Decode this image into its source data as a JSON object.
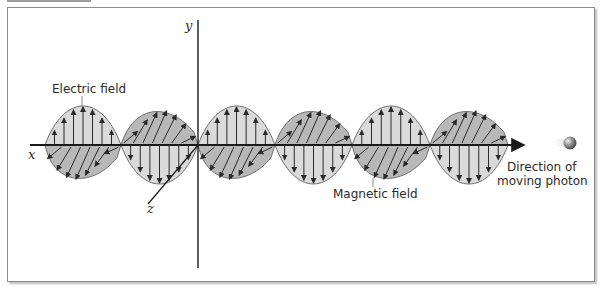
{
  "figure": {
    "axes": {
      "x_label": "x",
      "y_label": "y",
      "z_label": "z"
    },
    "labels": {
      "electric_field": "Electric field",
      "magnetic_field": "Magnetic field",
      "direction_line1": "Direction of",
      "direction_line2": "moving photon"
    },
    "colors": {
      "wave_fill": "#d3d3d3",
      "hatched_fill": "#b8b8b8",
      "stroke": "#6e6e6e",
      "arrow": "#2a2a2a",
      "axis": "#1a1a1a",
      "photon": "#8a8a8a"
    },
    "geometry": {
      "axis_y_level": 145,
      "axis_x_start": 30,
      "axis_x_end": 522,
      "y_axis_x": 198,
      "y_axis_top": 20,
      "y_axis_bottom": 268,
      "nodes": [
        45,
        121,
        198,
        275,
        352,
        430,
        508
      ],
      "electric_amplitude": 40,
      "magnetic_amplitude": 36
    },
    "icons": {
      "photon": "sphere-icon"
    }
  }
}
